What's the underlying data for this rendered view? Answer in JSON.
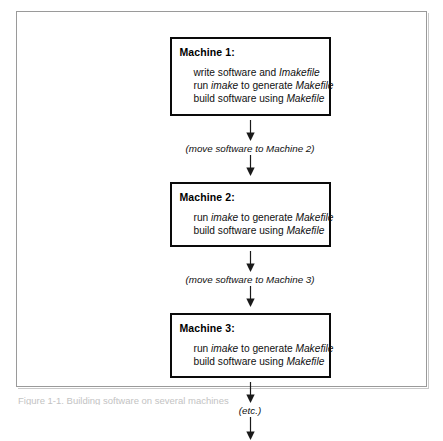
{
  "figure": {
    "background_color": "#ffffff",
    "frame_color": "#9a9a9a",
    "box_border_color": "#0a0a0a",
    "shadow_color": "#b8b8b8",
    "text_color": "#111111"
  },
  "flow": {
    "boxes": [
      {
        "title": "Machine 1:",
        "steps": [
          {
            "pre": "write software and ",
            "em": "Imakefile",
            "post": ""
          },
          {
            "pre": "run ",
            "em": "imake",
            "post": " to generate ",
            "em2": "Makefile",
            "post2": ""
          },
          {
            "pre": "build software using ",
            "em": "Makefile",
            "post": ""
          }
        ]
      },
      {
        "title": "Machine 2:",
        "steps": [
          {
            "pre": "run ",
            "em": "imake",
            "post": " to generate ",
            "em2": "Makefile",
            "post2": ""
          },
          {
            "pre": "build software using ",
            "em": "Makefile",
            "post": ""
          }
        ]
      },
      {
        "title": "Machine 3:",
        "steps": [
          {
            "pre": "run ",
            "em": "imake",
            "post": " to generate ",
            "em2": "Makefile",
            "post2": ""
          },
          {
            "pre": "build software using ",
            "em": "Makefile",
            "post": ""
          }
        ]
      }
    ],
    "connectors": [
      {
        "label": "(move software to Machine 2)"
      },
      {
        "label": "(move software to Machine 3)"
      },
      {
        "label": "(etc.)"
      }
    ]
  },
  "caption": {
    "text": "Figure 1-1. Building software on several machines"
  }
}
